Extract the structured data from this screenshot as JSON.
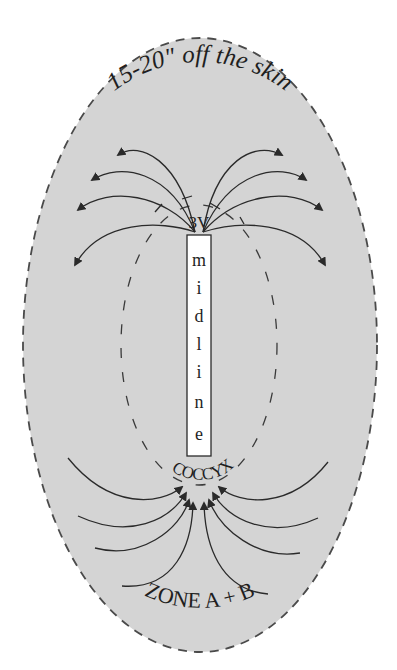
{
  "diagram": {
    "top_label": "15-20\" off the skin",
    "top_marker": "3V",
    "midline_letters": [
      "m",
      "i",
      "d",
      "l",
      "i",
      "n",
      "e"
    ],
    "midline_label": "midline",
    "bottom_marker": "COCCYX",
    "bottom_label": "ZONE A + B",
    "colors": {
      "field_fill": "#d4d4d4",
      "line": "#2a2a2a",
      "box_fill": "#ffffff"
    }
  }
}
